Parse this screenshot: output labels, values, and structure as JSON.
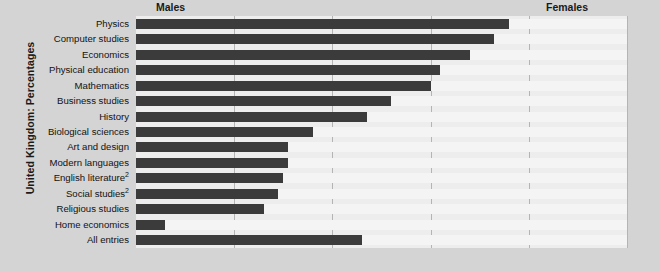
{
  "axis_title": "United Kingdom: Percentages",
  "groups": {
    "males_label": "Males",
    "females_label": "Females"
  },
  "xticks": [
    "0%",
    "20%",
    "40%",
    "60%",
    "80%",
    "100%"
  ],
  "colors": {
    "male_bar": "#3b3b3b",
    "female_bar": "#f4f4f4",
    "background": "#d4d4d4",
    "plot_background": "#ededed",
    "gridline": "#b4b4b4",
    "text": "#121212"
  },
  "chart_data": {
    "type": "bar",
    "orientation": "horizontal",
    "stacked": true,
    "title": "",
    "subtitle": "",
    "xlabel": "",
    "ylabel": "United Kingdom: Percentages",
    "xlim": [
      0,
      100
    ],
    "grid": true,
    "legend_position": "top",
    "categories": [
      "Physics",
      "Computer studies",
      "Economics",
      "Physical education",
      "Mathematics",
      "Business studies",
      "History",
      "Biological sciences",
      "Art and design",
      "Modern languages",
      "English literature2",
      "Social studies2",
      "Religious studies",
      "Home economics",
      "All entries"
    ],
    "category_labels_html": [
      "Physics",
      "Computer studies",
      "Economics",
      "Physical education",
      "Mathematics",
      "Business studies",
      "History",
      "Biological sciences",
      "Art and design",
      "Modern languages",
      "English literature<sup>2</sup>",
      "Social studies<sup>2</sup>",
      "Religious studies",
      "Home economics",
      "All entries"
    ],
    "series": [
      {
        "name": "Males",
        "values": [
          76,
          73,
          68,
          62,
          60,
          52,
          47,
          36,
          31,
          31,
          30,
          29,
          26,
          6,
          46
        ]
      },
      {
        "name": "Females",
        "values": [
          24,
          27,
          32,
          38,
          40,
          48,
          53,
          64,
          69,
          69,
          70,
          71,
          74,
          94,
          54
        ]
      }
    ],
    "xtick_values": [
      0,
      20,
      40,
      60,
      80,
      100
    ]
  }
}
